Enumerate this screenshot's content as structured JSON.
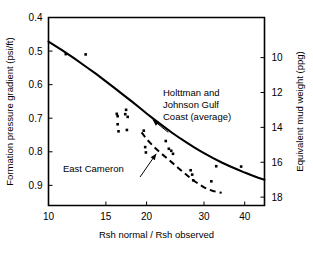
{
  "chart_data": {
    "type": "scatter",
    "title": "",
    "xlabel": "Rsh normal / Rsh observed",
    "ylabel": "Formation pressure gradient (psi/ft)",
    "y2label": "Equivalent mud weight (ppg)",
    "xscale": "log",
    "xlim": [
      10,
      46
    ],
    "xticks": [
      10,
      15,
      20,
      30,
      40
    ],
    "xticklabels": [
      "10",
      "15",
      "20",
      "30",
      "40"
    ],
    "ylim": [
      0.4,
      0.96
    ],
    "yticks": [
      0.4,
      0.5,
      0.6,
      0.7,
      0.8,
      0.9
    ],
    "yticklabels": [
      "0.4",
      "0.5",
      "0.6",
      "0.7",
      "0.8",
      "0.9"
    ],
    "y_inverted": true,
    "y2ticks": [
      10,
      12,
      14,
      16,
      18
    ],
    "y2ticklabels": [
      "10",
      "12",
      "14",
      "16",
      "18"
    ],
    "grid": false,
    "legend": "none",
    "series": [
      {
        "name": "Holttman and Johnson Gulf Coast (average)",
        "type": "line",
        "style": "solid",
        "points": [
          [
            10.0,
            0.472
          ],
          [
            11.0,
            0.497
          ],
          [
            12.0,
            0.522
          ],
          [
            13.0,
            0.546
          ],
          [
            14.0,
            0.568
          ],
          [
            15.0,
            0.59
          ],
          [
            16.0,
            0.611
          ],
          [
            17.0,
            0.631
          ],
          [
            18.0,
            0.65
          ],
          [
            19.0,
            0.668
          ],
          [
            20.0,
            0.686
          ],
          [
            21.0,
            0.702
          ],
          [
            22.0,
            0.717
          ],
          [
            23.0,
            0.731
          ],
          [
            24.0,
            0.744
          ],
          [
            25.0,
            0.756
          ],
          [
            26.0,
            0.767
          ],
          [
            27.0,
            0.777
          ],
          [
            28.0,
            0.787
          ],
          [
            29.0,
            0.796
          ],
          [
            30.0,
            0.804
          ],
          [
            32.0,
            0.819
          ],
          [
            34.0,
            0.832
          ],
          [
            36.0,
            0.843
          ],
          [
            38.0,
            0.853
          ],
          [
            40.0,
            0.862
          ],
          [
            42.0,
            0.87
          ],
          [
            44.0,
            0.877
          ],
          [
            46.0,
            0.883
          ]
        ]
      },
      {
        "name": "East Cameron",
        "type": "line",
        "style": "dashed",
        "points": [
          [
            19.3,
            0.742
          ],
          [
            20.0,
            0.762
          ],
          [
            21.0,
            0.784
          ],
          [
            22.0,
            0.802
          ],
          [
            23.0,
            0.818
          ],
          [
            24.0,
            0.833
          ],
          [
            25.0,
            0.848
          ],
          [
            26.0,
            0.862
          ],
          [
            27.0,
            0.875
          ],
          [
            28.0,
            0.887
          ],
          [
            29.0,
            0.897
          ],
          [
            30.0,
            0.906
          ],
          [
            31.0,
            0.912
          ],
          [
            32.0,
            0.917
          ],
          [
            33.0,
            0.92
          ],
          [
            34.0,
            0.922
          ]
        ]
      },
      {
        "name": "Measured data",
        "type": "scatter",
        "marker": "dot",
        "points": [
          [
            11.3,
            0.509
          ],
          [
            13.0,
            0.51
          ],
          [
            16.2,
            0.687
          ],
          [
            16.3,
            0.694
          ],
          [
            16.3,
            0.718
          ],
          [
            16.4,
            0.739
          ],
          [
            17.2,
            0.688
          ],
          [
            17.3,
            0.675
          ],
          [
            17.4,
            0.735
          ],
          [
            17.5,
            0.696
          ],
          [
            19.6,
            0.737
          ],
          [
            19.8,
            0.786
          ],
          [
            19.9,
            0.802
          ],
          [
            22.9,
            0.768
          ],
          [
            23.4,
            0.791
          ],
          [
            23.8,
            0.797
          ],
          [
            24.1,
            0.806
          ],
          [
            27.3,
            0.855
          ],
          [
            27.6,
            0.868
          ],
          [
            27.8,
            0.885
          ],
          [
            31.6,
            0.888
          ],
          [
            32.7,
            0.843
          ],
          [
            39.0,
            0.844
          ]
        ]
      }
    ],
    "annotations": [
      {
        "id": "holttman-annotation",
        "lines": [
          "Holttman and",
          "Johnson Gulf",
          "Coast (average)"
        ],
        "text": "Holttman and Johnson Gulf Coast (average)",
        "leader": {
          "from_x": 23.3,
          "from_y": 0.742,
          "to_x": 20.9,
          "to_y": 0.705
        }
      },
      {
        "id": "east-cameron-annotation",
        "lines": [
          "East Cameron"
        ],
        "text": "East Cameron",
        "leader": {
          "from_x": 19.1,
          "from_y": 0.875,
          "to_x": 21.4,
          "to_y": 0.806
        }
      }
    ]
  }
}
